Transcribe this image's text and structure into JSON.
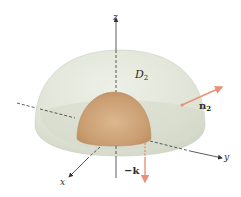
{
  "diagram": {
    "colors": {
      "outer_hemisphere": "#dfe3d6",
      "outer_hemisphere_edge": "#c9cfbd",
      "inner_hemisphere": "#c99d70",
      "inner_hemisphere_highlight": "#dcb78f",
      "axis": "#333333",
      "vector": "#e8907a"
    },
    "axes": {
      "z_label": "z",
      "y_label": "y",
      "x_label": "x"
    },
    "labels": {
      "region": "D",
      "region_sub": "2",
      "normal_outer": "n",
      "normal_outer_sub": "2",
      "normal_base": "−k"
    }
  }
}
